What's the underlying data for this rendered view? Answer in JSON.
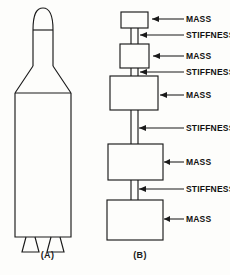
{
  "figure": {
    "background_color": "#fdfdfb",
    "line_color": "#1a1a1a",
    "panels": [
      {
        "id": "A",
        "caption": "(A)",
        "description": "launch-vehicle-outline"
      },
      {
        "id": "B",
        "caption": "(B)",
        "description": "lumped-mass-stiffness-model"
      }
    ]
  },
  "panel_a": {
    "caption": "(A)",
    "parts": [
      {
        "name": "nose-cone"
      },
      {
        "name": "upper-stage-cylinder"
      },
      {
        "name": "interstage-flare"
      },
      {
        "name": "main-body-cylinder"
      },
      {
        "name": "nozzle-left"
      },
      {
        "name": "nozzle-right"
      }
    ]
  },
  "panel_b": {
    "caption": "(B)",
    "elements": [
      {
        "index": 1,
        "type": "mass",
        "label": "MASS"
      },
      {
        "index": 2,
        "type": "stiffness",
        "label": "STIFFNESS"
      },
      {
        "index": 3,
        "type": "mass",
        "label": "MASS"
      },
      {
        "index": 4,
        "type": "stiffness",
        "label": "STIFFNESS"
      },
      {
        "index": 5,
        "type": "mass",
        "label": "MASS"
      },
      {
        "index": 6,
        "type": "stiffness",
        "label": "STIFFNESS"
      },
      {
        "index": 7,
        "type": "mass",
        "label": "MASS"
      },
      {
        "index": 8,
        "type": "stiffness",
        "label": "STIFFNESS"
      },
      {
        "index": 9,
        "type": "mass",
        "label": "MASS"
      }
    ],
    "annotations": [
      {
        "id": "a1",
        "label": "MASS",
        "target": "mass-box-1"
      },
      {
        "id": "a2",
        "label": "STIFFNESS",
        "target": "stiffness-rod-1"
      },
      {
        "id": "a3",
        "label": "MASS",
        "target": "mass-box-2"
      },
      {
        "id": "a4",
        "label": "STIFFNESS",
        "target": "stiffness-rod-2"
      },
      {
        "id": "a5",
        "label": "MASS",
        "target": "mass-box-3"
      },
      {
        "id": "a6",
        "label": "STIFFNESS",
        "target": "stiffness-rod-3"
      },
      {
        "id": "a7",
        "label": "MASS",
        "target": "mass-box-4"
      },
      {
        "id": "a8",
        "label": "STIFFNESS",
        "target": "stiffness-rod-4"
      },
      {
        "id": "a9",
        "label": "MASS",
        "target": "mass-box-5"
      }
    ]
  }
}
